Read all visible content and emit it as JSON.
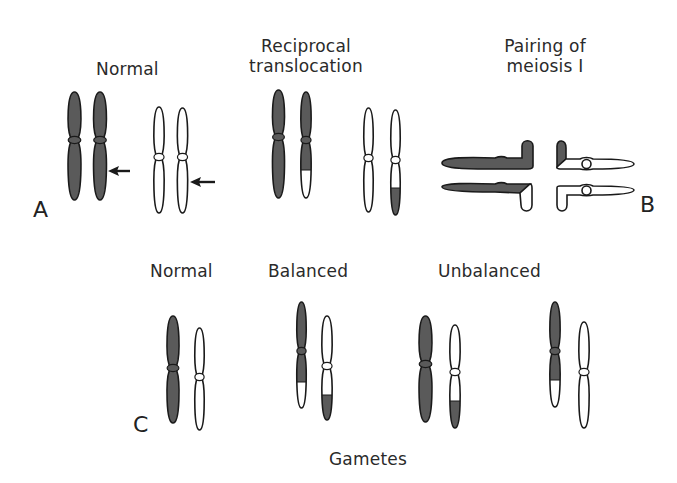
{
  "colors": {
    "dark": "#5a5a5a",
    "light": "#ffffff",
    "stroke": "#1a1a1a",
    "text": "#2a2a2a"
  },
  "labels": {
    "normal_top": "Normal",
    "translocation_line1": "Reciprocal",
    "translocation_line2": "translocation",
    "pairing_line1": "Pairing of",
    "pairing_line2": "meiosis I",
    "normal_bottom": "Normal",
    "balanced": "Balanced",
    "unbalanced": "Unbalanced",
    "gametes": "Gametes"
  },
  "panels": {
    "a": "A",
    "b": "B",
    "c": "C"
  },
  "chromosomes": [
    {
      "id": "A-normal-dark-1",
      "x": 74.5,
      "top": 92,
      "bottom": 200,
      "cen": 140,
      "w": 15,
      "fill": "dark",
      "tip": null
    },
    {
      "id": "A-normal-dark-2",
      "x": 100,
      "top": 92,
      "bottom": 200,
      "cen": 140,
      "w": 15,
      "fill": "dark",
      "tip": null
    },
    {
      "id": "A-normal-white-1",
      "x": 159,
      "top": 107,
      "bottom": 213,
      "cen": 157,
      "w": 12,
      "fill": "light",
      "tip": null
    },
    {
      "id": "A-normal-white-2",
      "x": 182.5,
      "top": 108,
      "bottom": 213,
      "cen": 157,
      "w": 12,
      "fill": "light",
      "tip": null
    },
    {
      "id": "A-trans-dark-1",
      "x": 278.5,
      "top": 90,
      "bottom": 198,
      "cen": 137,
      "w": 14,
      "fill": "dark",
      "tip": null
    },
    {
      "id": "A-trans-dark-2",
      "x": 306,
      "top": 92,
      "bottom": 198,
      "cen": 140,
      "w": 12,
      "fill": "dark",
      "tip": {
        "from": 170,
        "fill": "light"
      }
    },
    {
      "id": "A-trans-white-1",
      "x": 368.5,
      "top": 108,
      "bottom": 212,
      "cen": 158,
      "w": 11,
      "fill": "light",
      "tip": null
    },
    {
      "id": "A-trans-white-2",
      "x": 395.5,
      "top": 110,
      "bottom": 215,
      "cen": 160,
      "w": 11,
      "fill": "light",
      "tip": {
        "from": 188,
        "fill": "dark"
      }
    },
    {
      "id": "C-normal-dark",
      "x": 173,
      "top": 316,
      "bottom": 423,
      "cen": 368,
      "w": 14,
      "fill": "dark",
      "tip": null
    },
    {
      "id": "C-normal-white",
      "x": 199.5,
      "top": 328,
      "bottom": 430,
      "cen": 377,
      "w": 11,
      "fill": "light",
      "tip": null
    },
    {
      "id": "C-balanced-dark",
      "x": 301.5,
      "top": 302,
      "bottom": 408,
      "cen": 351,
      "w": 11,
      "fill": "dark",
      "tip": {
        "from": 382,
        "fill": "light"
      }
    },
    {
      "id": "C-balanced-white",
      "x": 327,
      "top": 316,
      "bottom": 420,
      "cen": 366,
      "w": 12,
      "fill": "light",
      "tip": {
        "from": 395,
        "fill": "dark"
      }
    },
    {
      "id": "C-unbal1-dark",
      "x": 425.5,
      "top": 316,
      "bottom": 422,
      "cen": 364,
      "w": 15,
      "fill": "dark",
      "tip": null
    },
    {
      "id": "C-unbal1-white",
      "x": 455,
      "top": 325,
      "bottom": 428,
      "cen": 372,
      "w": 12,
      "fill": "light",
      "tip": {
        "from": 401,
        "fill": "dark"
      }
    },
    {
      "id": "C-unbal2-dark",
      "x": 555,
      "top": 302,
      "bottom": 407,
      "cen": 351,
      "w": 12,
      "fill": "dark",
      "tip": {
        "from": 380,
        "fill": "light"
      }
    },
    {
      "id": "C-unbal2-white",
      "x": 584,
      "top": 322,
      "bottom": 428,
      "cen": 372,
      "w": 12,
      "fill": "light",
      "tip": null
    }
  ],
  "arrows": [
    {
      "id": "arrow-dark",
      "x1": 130,
      "x2": 108,
      "y": 171
    },
    {
      "id": "arrow-white",
      "x1": 215,
      "x2": 190,
      "y": 182
    }
  ]
}
